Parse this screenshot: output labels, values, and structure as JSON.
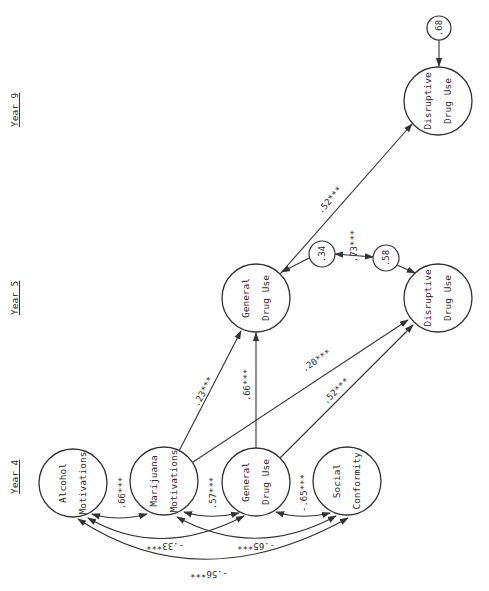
{
  "year_labels": [
    {
      "id": "year9",
      "text": "Year 9",
      "x": 14,
      "y": 115
    },
    {
      "id": "year5",
      "text": "Year 5",
      "x": 14,
      "y": 303
    },
    {
      "id": "year4",
      "text": "Year 4",
      "x": 14,
      "y": 482
    }
  ],
  "nodes": [
    {
      "id": "alcohol_motivations",
      "line1": "Alcohol",
      "line2": "Motivations",
      "cx": 73,
      "cy": 483,
      "r": 34
    },
    {
      "id": "marijuana_motivations",
      "line1": "Marijuana",
      "line2": "Motivations",
      "cx": 164,
      "cy": 481,
      "r": 34
    },
    {
      "id": "general_drug_use_y4",
      "line1": "General",
      "line2": "Drug Use",
      "cx": 256,
      "cy": 482,
      "r": 34
    },
    {
      "id": "social_conformity",
      "line1": "Social",
      "line2": "Conformity",
      "cx": 347,
      "cy": 481,
      "r": 34
    },
    {
      "id": "general_drug_use_y5",
      "line1": "General",
      "line2": "Drug Use",
      "cx": 256,
      "cy": 298,
      "r": 34
    },
    {
      "id": "disruptive_drug_use_y5",
      "line1": "Disruptive",
      "line2": "Drug Use",
      "cx": 438,
      "cy": 298,
      "r": 34
    },
    {
      "id": "disruptive_drug_use_y9",
      "line1": "Disruptive",
      "line2": "Drug Use",
      "cx": 438,
      "cy": 101,
      "r": 34
    }
  ],
  "residuals": [
    {
      "id": "resid_ddu_y9",
      "value": ".68",
      "cx": 439,
      "cy": 28,
      "r": 12,
      "target": "disruptive_drug_use_y9"
    },
    {
      "id": "resid_gdu_y5",
      "value": ".34",
      "cx": 322,
      "cy": 254,
      "r": 13,
      "target": "general_drug_use_y5"
    },
    {
      "id": "resid_ddu_y5",
      "value": ".58",
      "cx": 386,
      "cy": 258,
      "r": 13,
      "target": "disruptive_drug_use_y5"
    }
  ],
  "paths": [
    {
      "id": "mm_to_gdu5",
      "from": "marijuana_motivations",
      "to": "general_drug_use_y5",
      "coef": ".23***",
      "lx": 210,
      "ly": 395
    },
    {
      "id": "gdu4_to_gdu5",
      "from": "general_drug_use_y4",
      "to": "general_drug_use_y5",
      "coef": ".66***",
      "lx": 246,
      "ly": 390
    },
    {
      "id": "mm_to_ddu5",
      "from": "marijuana_motivations",
      "to": "disruptive_drug_use_y5",
      "coef": ".20***",
      "lx": 318,
      "ly": 367
    },
    {
      "id": "gdu4_to_ddu5",
      "from": "general_drug_use_y4",
      "to": "disruptive_drug_use_y5",
      "coef": ".52***",
      "lx": 332,
      "ly": 400
    },
    {
      "id": "gdu5_to_ddu9",
      "from": "general_drug_use_y5",
      "to": "disruptive_drug_use_y9",
      "coef": ".52***",
      "lx": 329,
      "ly": 205
    }
  ],
  "correlations": [
    {
      "id": "am_mm",
      "a": "alcohol_motivations",
      "b": "marijuana_motivations",
      "coef": ".66***",
      "lx": 118,
      "ly": 462
    },
    {
      "id": "mm_gdu4",
      "a": "marijuana_motivations",
      "b": "general_drug_use_y4",
      "coef": ".57***",
      "lx": 210,
      "ly": 462
    },
    {
      "id": "gdu4_sc",
      "a": "general_drug_use_y4",
      "b": "social_conformity",
      "coef": "-.65***",
      "lx": 301,
      "ly": 462
    },
    {
      "id": "am_gdu4",
      "a": "alcohol_motivations",
      "b": "general_drug_use_y4",
      "coef": "-.33***",
      "lx": 161,
      "ly": 546,
      "inverted": true
    },
    {
      "id": "mm_sc",
      "a": "marijuana_motivations",
      "b": "social_conformity",
      "coef": "-.65***",
      "lx": 252,
      "ly": 546,
      "inverted": true
    },
    {
      "id": "am_sc",
      "a": "alcohol_motivations",
      "b": "social_conformity",
      "coef": "-.56***",
      "lx": 207,
      "ly": 574,
      "inverted": true
    },
    {
      "id": "resid_gdu5_ddu5",
      "a": "resid_gdu_y5",
      "b": "resid_ddu_y5",
      "coef": ".73***",
      "lx": 356,
      "ly": 242
    }
  ],
  "colors": {
    "ink": "#333333",
    "background": "#ffffff"
  }
}
